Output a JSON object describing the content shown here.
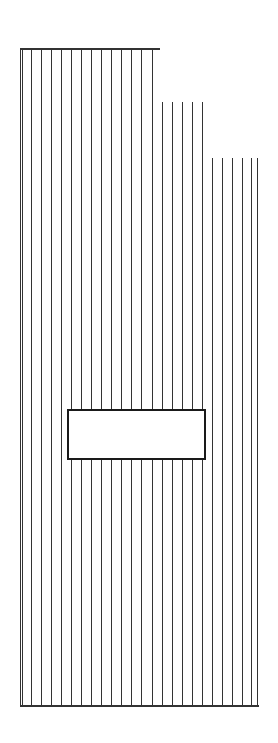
{
  "diagram": {
    "type": "line-drawing",
    "stroke_color": "#333333",
    "background": "#ffffff",
    "baseline_y": 705,
    "top_rail": {
      "x1": 20,
      "x2": 160,
      "y": 48
    },
    "bottom_rail": {
      "x1": 20,
      "x2": 259,
      "y": 705
    },
    "line_groups": [
      {
        "name": "left-block",
        "top_y": 48,
        "xs": [
          20,
          22,
          31,
          41,
          51,
          61,
          71,
          81,
          91,
          101,
          111,
          121,
          131,
          141,
          152
        ]
      },
      {
        "name": "middle-block",
        "top_y": 102,
        "xs": [
          162,
          172,
          182,
          192,
          202
        ]
      },
      {
        "name": "right-block",
        "top_y": 158,
        "xs": [
          212,
          222,
          232,
          242,
          251,
          257
        ]
      }
    ],
    "center_box": {
      "x": 67,
      "y": 409,
      "width": 139,
      "height": 51,
      "border_width": 2,
      "fill": "#ffffff"
    }
  }
}
